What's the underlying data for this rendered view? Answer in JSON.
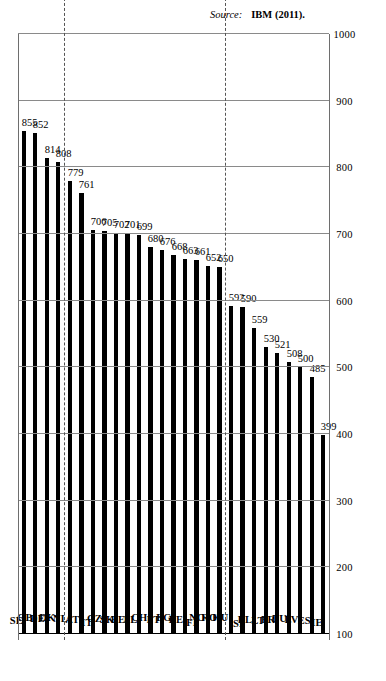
{
  "chart_data": {
    "type": "bar",
    "title": "",
    "xlabel": "",
    "ylabel": "",
    "orientation": "vertical-rotated",
    "grid": true,
    "ylim": [
      100,
      1000
    ],
    "yticks": [
      100,
      200,
      300,
      400,
      500,
      600,
      700,
      800,
      900,
      1000
    ],
    "categories": [
      "SE",
      "GB",
      "DE",
      "DK",
      "NL",
      "AT",
      "IT",
      "CZ",
      "SK",
      "EE",
      "PL",
      "CH",
      "PT",
      "BG",
      "BE",
      "FI",
      "NO",
      "RO",
      "HU",
      "SI",
      "EL",
      "LT",
      "FR",
      "LU",
      "LV",
      "ES",
      "IE"
    ],
    "values": [
      855,
      852,
      814,
      808,
      779,
      761,
      706,
      705,
      702,
      701,
      699,
      680,
      676,
      668,
      663,
      661,
      652,
      650,
      592,
      590,
      559,
      530,
      521,
      508,
      500,
      485,
      399
    ],
    "groups": [
      {
        "name": "Advanced",
        "start": 0,
        "end": 3
      },
      {
        "name": "On Schedule",
        "start": 4,
        "end": 17
      },
      {
        "name": "Delayed",
        "start": 18,
        "end": 26
      }
    ],
    "legend": []
  },
  "axis": {
    "tick_labels": [
      "100",
      "200",
      "300",
      "400",
      "500",
      "600",
      "700",
      "800",
      "900",
      "1000"
    ]
  },
  "groups": {
    "advanced": "Advanced",
    "on_schedule": "On Schedule",
    "delayed": "Delayed"
  },
  "footer": {
    "source_label": "Source:",
    "source_value": "IBM (2011)."
  }
}
